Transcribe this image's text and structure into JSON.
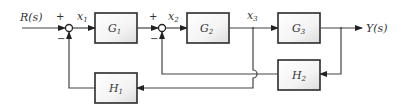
{
  "diagram": {
    "type": "block-diagram",
    "input": {
      "label": "R(s)"
    },
    "output": {
      "label": "Y(s)"
    },
    "summing_junctions": [
      {
        "id": "sum1",
        "plus_sign": "+",
        "minus_sign": "−",
        "output_signal": "x",
        "output_sub": "1"
      },
      {
        "id": "sum2",
        "plus_sign": "+",
        "minus_sign": "−",
        "output_signal": "x",
        "output_sub": "2"
      }
    ],
    "blocks": [
      {
        "id": "G1",
        "name": "G",
        "sub": "1"
      },
      {
        "id": "G2",
        "name": "G",
        "sub": "2"
      },
      {
        "id": "G3",
        "name": "G",
        "sub": "3"
      },
      {
        "id": "H1",
        "name": "H",
        "sub": "1"
      },
      {
        "id": "H2",
        "name": "H",
        "sub": "2"
      }
    ],
    "signals": [
      {
        "name": "x",
        "sub": "3"
      }
    ],
    "connections": [
      "R(s) -> sum1(+)",
      "sum1 -> G1 (x1)",
      "G1 -> sum2(+)",
      "sum2 -> G2 (x2)",
      "G2 -> G3 (x3)",
      "G3 -> Y(s)",
      "Y(s) -> H2 -> sum2(−)",
      "x3 -> H1 -> sum1(−)"
    ]
  }
}
